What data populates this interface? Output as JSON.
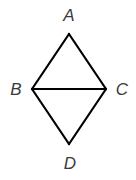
{
  "diagram": {
    "type": "geometry-figure",
    "vertices": [
      {
        "id": "A",
        "label": "A"
      },
      {
        "id": "B",
        "label": "B"
      },
      {
        "id": "C",
        "label": "C"
      },
      {
        "id": "D",
        "label": "D"
      }
    ],
    "edges": [
      {
        "from": "A",
        "to": "B",
        "name": "AB"
      },
      {
        "from": "A",
        "to": "C",
        "name": "AC"
      },
      {
        "from": "B",
        "to": "C",
        "name": "BC"
      },
      {
        "from": "B",
        "to": "D",
        "name": "BD"
      },
      {
        "from": "C",
        "to": "D",
        "name": "CD"
      }
    ],
    "colors": {
      "line": "#000000",
      "label": "#3a3a3a",
      "background": "#ffffff"
    }
  }
}
